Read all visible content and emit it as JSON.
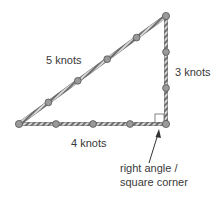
{
  "labels": {
    "hypotenuse": "5 knots",
    "vertical": "3 knots",
    "base": "4 knots",
    "callout_line1": "right angle /",
    "callout_line2": "square corner"
  },
  "colors": {
    "rope": "#6e6e6e",
    "rope_highlight": "#d8d8d8",
    "knot": "#8a8a8a",
    "text": "#3a3a3a"
  }
}
